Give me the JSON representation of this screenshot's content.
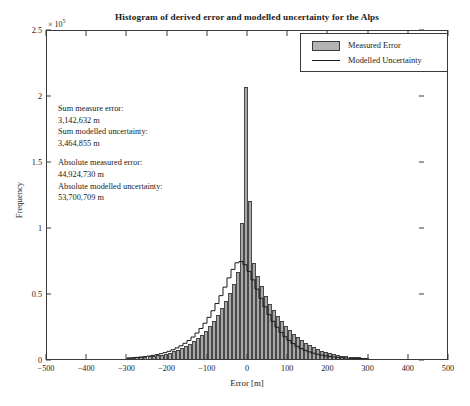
{
  "chart_data": {
    "type": "bar",
    "title": "Histogram of derived error and modelled uncertainty for the Alps",
    "xlabel": "Error [m]",
    "ylabel": "Frequency",
    "y_exponent_label": "× 10",
    "y_exponent_power": "5",
    "xlim": [
      -500,
      500
    ],
    "ylim": [
      0,
      250000
    ],
    "xticks": [
      -500,
      -400,
      -300,
      -200,
      -100,
      0,
      100,
      200,
      300,
      400,
      500
    ],
    "xtick_labels": [
      "−500",
      "−400",
      "−300",
      "−200",
      "−100",
      "0",
      "100",
      "200",
      "300",
      "400",
      "500"
    ],
    "yticks": [
      0,
      50000,
      100000,
      150000,
      200000,
      250000
    ],
    "ytick_labels": [
      "0",
      "0.5",
      "1",
      "1.5",
      "2",
      "2.5"
    ],
    "grid": false,
    "bin_width": 10,
    "legend_position": "top-right",
    "series": [
      {
        "name": "Measured Error",
        "style": "filled-bars",
        "color": "#a8a8a8",
        "edge_color": "#3f3f3f",
        "x": [
          -295,
          -285,
          -275,
          -265,
          -255,
          -245,
          -235,
          -225,
          -215,
          -205,
          -195,
          -185,
          -175,
          -165,
          -155,
          -145,
          -135,
          -125,
          -115,
          -105,
          -95,
          -85,
          -75,
          -65,
          -55,
          -45,
          -35,
          -25,
          -15,
          -5,
          5,
          15,
          25,
          35,
          45,
          55,
          65,
          75,
          85,
          95,
          105,
          115,
          125,
          135,
          145,
          155,
          165,
          175,
          185,
          195,
          205,
          215,
          225,
          235,
          245,
          255,
          265,
          275,
          285,
          295
        ],
        "values": [
          900,
          1000,
          1200,
          1400,
          1700,
          2000,
          2400,
          2900,
          3400,
          4100,
          4900,
          5800,
          6900,
          8200,
          9700,
          11500,
          13500,
          15800,
          18500,
          21500,
          25000,
          29000,
          33500,
          38500,
          44000,
          50000,
          57000,
          66000,
          103000,
          206000,
          120000,
          73000,
          63000,
          55000,
          48000,
          42000,
          37000,
          32500,
          28500,
          25000,
          22000,
          19000,
          16500,
          14200,
          12200,
          10400,
          8800,
          7400,
          6200,
          5200,
          4300,
          3600,
          3000,
          2500,
          2050,
          1700,
          1400,
          1150,
          950,
          800
        ]
      },
      {
        "name": "Modelled Uncertainty",
        "style": "step-outline",
        "color": "#1a1a1a",
        "x": [
          -295,
          -285,
          -275,
          -265,
          -255,
          -245,
          -235,
          -225,
          -215,
          -205,
          -195,
          -185,
          -175,
          -165,
          -155,
          -145,
          -135,
          -125,
          -115,
          -105,
          -95,
          -85,
          -75,
          -65,
          -55,
          -45,
          -35,
          -25,
          -15,
          -5,
          5,
          15,
          25,
          35,
          45,
          55,
          65,
          75,
          85,
          95,
          105,
          115,
          125,
          135,
          145,
          155,
          165,
          175,
          185,
          195,
          205,
          215,
          225,
          235,
          245,
          255,
          265,
          275,
          285,
          295
        ],
        "values": [
          1100,
          1300,
          1500,
          1800,
          2100,
          2500,
          3000,
          3600,
          4300,
          5100,
          6100,
          7300,
          8700,
          10300,
          12200,
          14400,
          17000,
          20000,
          23500,
          27500,
          32000,
          37000,
          42500,
          48500,
          55000,
          62000,
          68500,
          73500,
          74500,
          72000,
          67000,
          60500,
          53500,
          46500,
          40000,
          34000,
          29000,
          24500,
          20500,
          17200,
          14400,
          12000,
          10000,
          8300,
          6900,
          5700,
          4700,
          3900,
          3200,
          2650,
          2200,
          1800,
          1500,
          1250,
          1030,
          850,
          700,
          580,
          480,
          400
        ]
      }
    ],
    "annotations": [
      "Sum measure error:",
      "3,142,632 m",
      "Sum modelled uncertainty:",
      "3,464,855 m",
      "",
      "Absolute measured error:",
      "44,924,730 m",
      "Absolute modelled uncertainty:",
      "53,700,709 m"
    ]
  }
}
